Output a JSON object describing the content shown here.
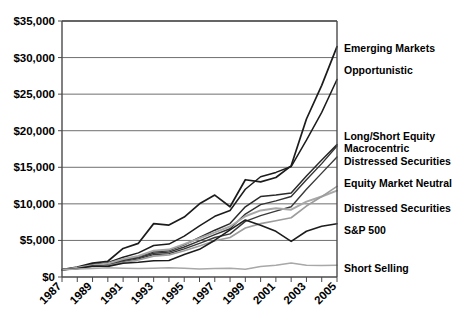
{
  "chart_data": {
    "type": "line",
    "title": "",
    "xlabel": "",
    "ylabel": "",
    "ylim": [
      0,
      35000
    ],
    "xlim": [
      1987,
      2005
    ],
    "grid": true,
    "legend_position": "right-inline-labels",
    "y_ticks": [
      "$0",
      "$5,000",
      "$10,000",
      "$15,000",
      "$20,000",
      "$25,000",
      "$30,000",
      "$35,000"
    ],
    "y_tick_values": [
      0,
      5000,
      10000,
      15000,
      20000,
      25000,
      30000,
      35000
    ],
    "x_tick_labels": [
      "1987",
      "1989",
      "1991",
      "1993",
      "1995",
      "1997",
      "1999",
      "2001",
      "2003",
      "2005"
    ],
    "x": [
      1987,
      1988,
      1989,
      1990,
      1991,
      1992,
      1993,
      1994,
      1995,
      1996,
      1997,
      1998,
      1999,
      2000,
      2001,
      2002,
      2003,
      2004,
      2005
    ],
    "series": [
      {
        "name": "Emerging Markets",
        "color": "#1c1c1c",
        "width": 1.7,
        "values": [
          1000,
          1350,
          1900,
          2150,
          3900,
          4600,
          7300,
          7100,
          8200,
          10000,
          11200,
          9600,
          13300,
          13000,
          13600,
          15200,
          21600,
          26200,
          31500
        ]
      },
      {
        "name": "Opportunistic",
        "color": "#1c1c1c",
        "width": 1.5,
        "values": [
          1000,
          1300,
          1700,
          1950,
          2700,
          3300,
          4300,
          4500,
          5600,
          7000,
          8300,
          9100,
          12000,
          13700,
          14300,
          15100,
          18700,
          22500,
          27000
        ]
      },
      {
        "name": "Long/Short Equity",
        "color": "#2a2a2a",
        "width": 1.5,
        "values": [
          1000,
          1250,
          1550,
          1750,
          2350,
          2750,
          3450,
          3600,
          4400,
          5400,
          6400,
          7300,
          9600,
          11000,
          11200,
          11500,
          13800,
          16000,
          18100
        ]
      },
      {
        "name": "Macrocentric",
        "color": "#333333",
        "width": 1.4,
        "values": [
          1000,
          1230,
          1500,
          1700,
          2250,
          2620,
          3250,
          3400,
          4100,
          4950,
          5800,
          6600,
          8600,
          9900,
          10400,
          11000,
          13300,
          15500,
          17900
        ]
      },
      {
        "name": "Distressed Securities",
        "color": "#3a3a3a",
        "width": 1.4,
        "values": [
          1000,
          1200,
          1450,
          1620,
          2100,
          2480,
          3050,
          3200,
          3850,
          4600,
          5400,
          5900,
          7600,
          8400,
          9000,
          9600,
          12000,
          14200,
          16400
        ]
      },
      {
        "name": "Equity Market Neutral",
        "color": "#a8a8a8",
        "width": 2.0,
        "values": [
          1000,
          1280,
          1620,
          1850,
          2450,
          2880,
          3600,
          3750,
          4500,
          5300,
          6100,
          6900,
          8300,
          9100,
          9400,
          9200,
          10300,
          11000,
          11800
        ]
      },
      {
        "name": "Distressed Securities",
        "color": "#9c9c9c",
        "width": 1.6,
        "values": [
          1000,
          1180,
          1400,
          1560,
          1980,
          2320,
          2850,
          3000,
          3600,
          4250,
          4950,
          5400,
          6700,
          7300,
          7700,
          8100,
          9700,
          11000,
          12400
        ]
      },
      {
        "name": "S&P 500",
        "color": "#1c1c1c",
        "width": 1.6,
        "values": [
          1000,
          1150,
          1500,
          1450,
          1880,
          2020,
          2220,
          2250,
          3080,
          3780,
          5030,
          6450,
          7800,
          7080,
          6240,
          4860,
          6250,
          6930,
          7270
        ]
      },
      {
        "name": "Short Selling",
        "color": "#a8a8a8",
        "width": 1.5,
        "values": [
          1000,
          1080,
          1150,
          1280,
          1200,
          1150,
          1180,
          1250,
          1180,
          1100,
          1150,
          1200,
          1050,
          1450,
          1600,
          1900,
          1620,
          1560,
          1600
        ]
      }
    ],
    "annotations": [
      {
        "text": "Emerging Markets",
        "y": 52
      },
      {
        "text": "Opportunistic",
        "y": 74
      },
      {
        "text": "Long/Short Equity",
        "y": 140
      },
      {
        "text": "Macrocentric",
        "y": 152
      },
      {
        "text": "Distressed Securities",
        "y": 165
      },
      {
        "text": "Equity Market Neutral",
        "y": 187
      },
      {
        "text": "Distressed Securities",
        "y": 212
      },
      {
        "text": "S&P 500",
        "y": 234
      },
      {
        "text": "Short Selling",
        "y": 272
      }
    ]
  }
}
